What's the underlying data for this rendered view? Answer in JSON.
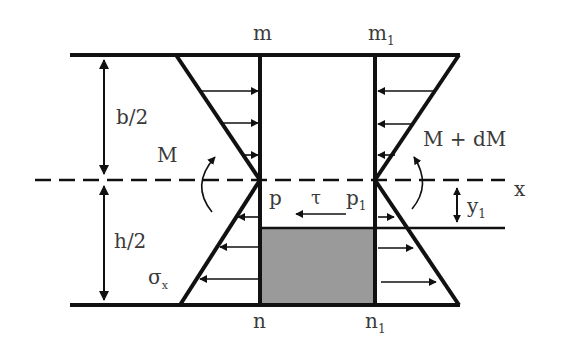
{
  "figure": {
    "type": "beam-element-bending-stress-diagram",
    "colors": {
      "stroke": "#111111",
      "shaded_region": "#9a9a9a",
      "text": "#3a3a3a"
    }
  },
  "labels": {
    "m": "m",
    "m1_base": "m",
    "m1_sub": "1",
    "n": "n",
    "n1_base": "n",
    "n1_sub": "1",
    "p": "p",
    "p1_base": "p",
    "p1_sub": "1",
    "tau": "τ",
    "x_axis": "x",
    "y1_base": "y",
    "y1_sub": "1",
    "half_b": "b/2",
    "half_h": "h/2",
    "moment_left": "M",
    "moment_right": "M + dM",
    "sigma_base": "σ",
    "sigma_sub": "x"
  },
  "stress_arrows": {
    "left_top": 3,
    "left_bottom": 3,
    "right_top": 3,
    "right_bottom": 3
  }
}
